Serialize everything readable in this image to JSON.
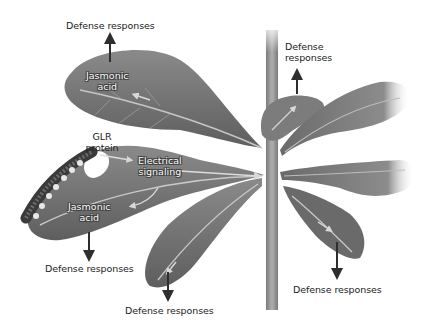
{
  "diagram": {
    "type": "plant-defense-signaling",
    "colors": {
      "leaf": "#6e6e6e",
      "leaf_light": "#8c8c8c",
      "leaf_dark": "#505050",
      "stem": "#9a9a9a",
      "vein": "#c8c8c8",
      "arrow": "#333333",
      "text": "#222222"
    },
    "labels": {
      "defense_top_left": "Defense responses",
      "defense_top_right": "Defense\nresponses",
      "defense_top_right_line1": "Defense",
      "defense_top_right_line2": "responses",
      "jasmonic_top_line1": "Jasmonic",
      "jasmonic_top_line2": "acid",
      "glr_line1": "GLR",
      "glr_line2": "protein",
      "electrical_line1": "Electrical",
      "electrical_line2": "signaling",
      "jasmonic_bottom_line1": "Jasmonic",
      "jasmonic_bottom_line2": "acid",
      "defense_bottom_left": "Defense responses",
      "defense_bottom_center": "Defense responses",
      "defense_bottom_right": "Defense responses"
    },
    "nodes": [
      {
        "id": "upper-left-leaf",
        "label": "Jasmonic acid",
        "output": "Defense responses",
        "arrow": "up"
      },
      {
        "id": "wounded-leaf",
        "label": "GLR protein / Jasmonic acid",
        "output": "Defense responses",
        "arrow": "down"
      },
      {
        "id": "center-lower-leaf",
        "output": "Defense responses",
        "arrow": "down"
      },
      {
        "id": "upper-right-small-leaf",
        "output": "Defense responses",
        "arrow": "up"
      },
      {
        "id": "lower-right-leaf",
        "output": "Defense responses",
        "arrow": "down"
      }
    ],
    "edges": [
      {
        "from": "wounded-leaf",
        "to": "stem-center",
        "label": "Electrical signaling"
      }
    ]
  }
}
